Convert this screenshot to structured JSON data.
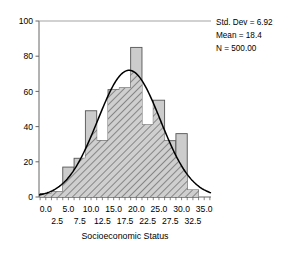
{
  "chart_data": {
    "type": "bar",
    "title": "",
    "subtitle": "",
    "xlabel": "Socioeconomic Status",
    "ylabel": "",
    "xlim": [
      -1.5,
      36.5
    ],
    "ylim": [
      0,
      100
    ],
    "grid": false,
    "legend_position": "none",
    "bin_width": 2.5,
    "bin_centers": [
      0.0,
      2.5,
      5.0,
      7.5,
      10.0,
      12.5,
      15.0,
      17.5,
      20.0,
      22.5,
      25.0,
      27.5,
      30.0,
      32.5
    ],
    "categories": [
      "0.0",
      "2.5",
      "5.0",
      "7.5",
      "10.0",
      "12.5",
      "15.0",
      "17.5",
      "20.0",
      "22.5",
      "25.0",
      "27.5",
      "30.0",
      "32.5"
    ],
    "values": [
      2,
      3,
      17,
      22,
      49,
      32,
      61,
      62,
      85,
      41,
      55,
      32,
      36,
      4
    ],
    "xticks_row1": [
      "0.0",
      "5.0",
      "10.0",
      "15.0",
      "20.0",
      "25.0",
      "30.0",
      "35.0"
    ],
    "xticks_row1_values": [
      0.0,
      5.0,
      10.0,
      15.0,
      20.0,
      25.0,
      30.0,
      35.0
    ],
    "xticks_row2": [
      "2.5",
      "7.5",
      "12.5",
      "17.5",
      "22.5",
      "27.5",
      "32.5"
    ],
    "xticks_row2_values": [
      2.5,
      7.5,
      12.5,
      17.5,
      22.5,
      27.5,
      32.5
    ],
    "yticks": [
      "0",
      "20",
      "40",
      "60",
      "80",
      "100"
    ],
    "ytick_values": [
      0,
      20,
      40,
      60,
      80,
      100
    ],
    "overlay_curve": {
      "name": "normal-distribution-curve",
      "mean": 18.4,
      "std_dev": 6.92,
      "n": 500,
      "peak_value": 72
    },
    "bar_fill_color": "#cccccc",
    "bar_border_color": "#555555",
    "curve_color": "#000000",
    "axis_color": "#666666"
  },
  "annotations": {
    "std_dev": "Std. Dev = 6.92",
    "mean": "Mean = 18.4",
    "n": "N = 500.00"
  },
  "axis": {
    "x_title": "Socioeconomic Status"
  }
}
